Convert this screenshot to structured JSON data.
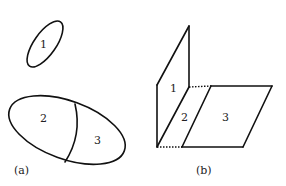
{
  "figure": {
    "panel_a": {
      "caption": "(a)",
      "regions": [
        {
          "label": "1",
          "shape": "small tilted ellipse"
        },
        {
          "label": "2",
          "shape": "left part of large ellipse"
        },
        {
          "label": "3",
          "shape": "right part of large ellipse"
        }
      ]
    },
    "panel_b": {
      "caption": "(b)",
      "regions": [
        {
          "label": "1",
          "shape": "vertical upper parallelogram"
        },
        {
          "label": "2",
          "shape": "slanted middle parallelogram"
        },
        {
          "label": "3",
          "shape": "horizontal right parallelogram"
        }
      ]
    },
    "colors": {
      "line": "#111111",
      "background": "#ffffff",
      "text": "#222222"
    }
  }
}
